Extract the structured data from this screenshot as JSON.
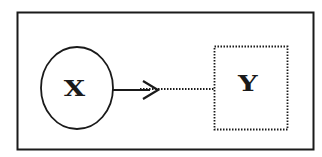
{
  "diagram": {
    "type": "causal-relationship",
    "nodes": [
      {
        "id": "x",
        "label": "X",
        "shape": "ellipse",
        "border": "solid"
      },
      {
        "id": "y",
        "label": "Y",
        "shape": "rectangle",
        "border": "dotted"
      }
    ],
    "edges": [
      {
        "from": "x",
        "to": "y",
        "style": "solid-arrow-then-dotted"
      }
    ],
    "colors": {
      "stroke": "#1a1a1a",
      "background": "#ffffff"
    }
  }
}
